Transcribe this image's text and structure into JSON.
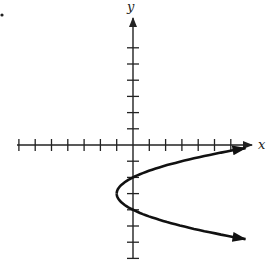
{
  "figure": {
    "marker": ".",
    "axis_labels": {
      "x": "x",
      "y": "y"
    }
  },
  "chart_data": {
    "type": "line",
    "title": "",
    "xlabel": "x",
    "ylabel": "y",
    "equation": "x = (y + 3)^2 - 1",
    "vertex": [
      -1,
      -3
    ],
    "y_intercepts": [
      -2,
      -4
    ],
    "xlim": [
      -7,
      7
    ],
    "ylim": [
      -7,
      7
    ],
    "x_ticks": [
      -7,
      -6,
      -5,
      -4,
      -3,
      -2,
      -1,
      1,
      2,
      3,
      4,
      5,
      6
    ],
    "y_ticks": [
      -7,
      -6,
      -5,
      -4,
      -3,
      -2,
      -1,
      1,
      2,
      3,
      4,
      5,
      6
    ],
    "tick_labels_shown": false,
    "grid": false,
    "series": [
      {
        "name": "parabola",
        "points": [
          [
            7,
            -0.17
          ],
          [
            3,
            -1
          ],
          [
            0,
            -2
          ],
          [
            -0.75,
            -2.5
          ],
          [
            -1,
            -3
          ],
          [
            -0.75,
            -3.5
          ],
          [
            0,
            -4
          ],
          [
            3,
            -5
          ],
          [
            7,
            -5.83
          ]
        ],
        "arrows": "both-ends"
      }
    ]
  },
  "style": {
    "axis_color": "#222222",
    "curve_color": "#111111",
    "background": "#ffffff"
  }
}
